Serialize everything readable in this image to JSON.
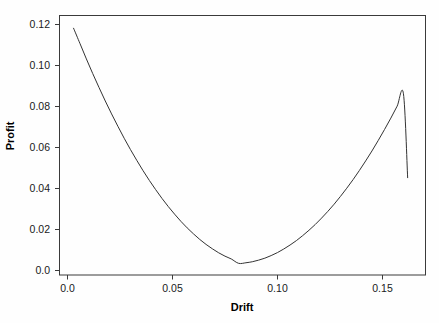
{
  "chart_data": {
    "type": "line",
    "title": "",
    "xlabel": "Drift",
    "ylabel": "Profit",
    "xlim": [
      -0.0038,
      0.1705
    ],
    "ylim": [
      -0.00585,
      0.1244
    ],
    "grid": false,
    "legend": "none",
    "x_ticks": [
      0.0,
      0.05,
      0.1,
      0.15
    ],
    "x_tick_labels": [
      "0.0",
      "0.05",
      "0.10",
      "0.15"
    ],
    "y_ticks": [
      0.0,
      0.02,
      0.04,
      0.06,
      0.08,
      0.1,
      0.12
    ],
    "y_tick_labels": [
      "0.0",
      "0.02",
      "0.04",
      "0.06",
      "0.08",
      "0.10",
      "0.12"
    ],
    "series": [
      {
        "name": "Profit vs Drift",
        "color": "#333333",
        "x": [
          0.0029,
          0.006,
          0.009,
          0.012,
          0.015,
          0.018,
          0.021,
          0.024,
          0.027,
          0.03,
          0.033,
          0.036,
          0.039,
          0.042,
          0.045,
          0.048,
          0.051,
          0.054,
          0.057,
          0.06,
          0.063,
          0.066,
          0.069,
          0.072,
          0.075,
          0.078,
          0.0815,
          0.085,
          0.088,
          0.091,
          0.094,
          0.097,
          0.1,
          0.103,
          0.106,
          0.109,
          0.112,
          0.115,
          0.118,
          0.121,
          0.124,
          0.127,
          0.13,
          0.133,
          0.136,
          0.139,
          0.142,
          0.145,
          0.148,
          0.151,
          0.154,
          0.157,
          0.16,
          0.162
        ],
        "y": [
          0.118,
          0.1102,
          0.1026,
          0.0953,
          0.0883,
          0.0815,
          0.075,
          0.0688,
          0.0628,
          0.0571,
          0.0517,
          0.0465,
          0.0416,
          0.037,
          0.0326,
          0.0285,
          0.0247,
          0.0211,
          0.0178,
          0.0148,
          0.012,
          0.0095,
          0.0073,
          0.0053,
          0.0036,
          0.0022,
          0.0,
          0.0003,
          0.0008,
          0.0016,
          0.0026,
          0.0039,
          0.0054,
          0.0072,
          0.0092,
          0.0114,
          0.0139,
          0.0166,
          0.0195,
          0.0227,
          0.0261,
          0.0297,
          0.0336,
          0.0377,
          0.042,
          0.0466,
          0.0514,
          0.0564,
          0.0617,
          0.0672,
          0.0729,
          0.0789,
          0.0851,
          0.043
        ]
      }
    ],
    "annotations": []
  },
  "axes": {
    "x_title": "Drift",
    "y_title": "Profit",
    "x_tick_labels": [
      "0.0",
      "0.05",
      "0.10",
      "0.15"
    ],
    "y_tick_labels": [
      "0.0",
      "0.02",
      "0.04",
      "0.06",
      "0.08",
      "0.10",
      "0.12"
    ]
  },
  "colors": {
    "curve": "#333333",
    "axis": "#3a3a3a",
    "text": "#1a1a1a",
    "background": "#fefefe"
  }
}
